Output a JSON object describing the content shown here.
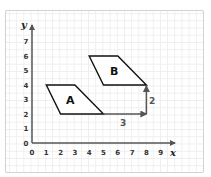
{
  "header": {
    "cutoff_text": ""
  },
  "axes": {
    "x_label": "x",
    "y_label": "y",
    "x_ticks": [
      "0",
      "1",
      "2",
      "3",
      "4",
      "5",
      "6",
      "7",
      "8",
      "9"
    ],
    "y_ticks": [
      "0",
      "1",
      "2",
      "3",
      "4",
      "5",
      "6",
      "7"
    ]
  },
  "shapes": [
    {
      "label": "A",
      "vertices": [
        [
          1,
          4
        ],
        [
          3,
          4
        ],
        [
          5,
          2
        ],
        [
          2,
          2
        ]
      ]
    },
    {
      "label": "B",
      "vertices": [
        [
          4,
          6
        ],
        [
          6,
          6
        ],
        [
          8,
          4
        ],
        [
          5,
          4
        ]
      ]
    }
  ],
  "translation": {
    "horizontal": {
      "from": [
        5,
        2
      ],
      "to": [
        8,
        2
      ],
      "label": "3"
    },
    "vertical": {
      "from": [
        8,
        2
      ],
      "to": [
        8,
        4
      ],
      "label": "2"
    }
  },
  "colors": {
    "axis": "#555555",
    "shape_stroke": "#111111",
    "vector": "#555555",
    "grid": "#eeeeee",
    "frame_border": "#d4d4d4"
  }
}
